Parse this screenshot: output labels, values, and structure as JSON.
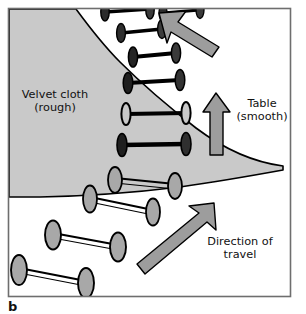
{
  "figure": {
    "panel_label": "b",
    "caption_labels": {
      "cloth": "Velvet cloth",
      "cloth_sub": "(rough)",
      "table": "Table",
      "table_sub": "(smooth)",
      "direction": "Direction of",
      "direction_sub": "travel"
    },
    "colors": {
      "cloth_fill": "#c9c9c9",
      "table_fill": "#ffffff",
      "arrow_fill": "#9d9d9d",
      "roller_disc_fill": "#a8a8a8",
      "roller_disc_dark": "#2b2b2b",
      "outline": "#000000",
      "frame": "#6e6e6e",
      "text": "#111111",
      "background": "#ffffff"
    },
    "frame": {
      "x": 8,
      "y": 8,
      "width": 283,
      "height": 289
    },
    "labels": [
      {
        "name": "velvet-cloth-label",
        "lines": [
          "Velvet cloth",
          "(rough)"
        ],
        "x": 55,
        "y": 98
      },
      {
        "name": "table-label",
        "lines": [
          "Table",
          "(smooth)"
        ],
        "x": 262,
        "y": 107
      },
      {
        "name": "direction-of-travel-label",
        "lines": [
          "Direction of",
          "travel"
        ],
        "x": 240,
        "y": 245
      }
    ],
    "arrows": [
      {
        "name": "arrow-top-left",
        "direction": "up-left"
      },
      {
        "name": "arrow-up",
        "direction": "up"
      },
      {
        "name": "arrow-direction-of-travel",
        "direction": "up-right"
      }
    ],
    "rollers": [
      {
        "name": "roller-1",
        "region": "cloth",
        "style": "dark"
      },
      {
        "name": "roller-2",
        "region": "cloth",
        "style": "dark"
      },
      {
        "name": "roller-3",
        "region": "cloth",
        "style": "dark"
      },
      {
        "name": "roller-4",
        "region": "cloth",
        "style": "dark"
      },
      {
        "name": "roller-5",
        "region": "cloth",
        "style": "dark"
      },
      {
        "name": "roller-6",
        "region": "cloth",
        "style": "dark"
      },
      {
        "name": "roller-7",
        "region": "cloth",
        "style": "dark"
      },
      {
        "name": "roller-8",
        "region": "boundary",
        "style": "light"
      },
      {
        "name": "roller-9",
        "region": "boundary",
        "style": "light"
      },
      {
        "name": "roller-10",
        "region": "table",
        "style": "light"
      },
      {
        "name": "roller-11",
        "region": "table",
        "style": "light"
      }
    ]
  }
}
